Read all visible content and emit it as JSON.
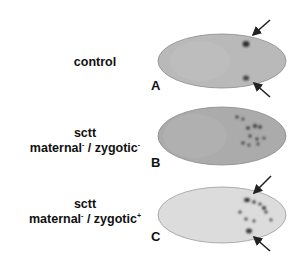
{
  "figure": {
    "panels": [
      {
        "letter": "A",
        "label_lines": [
          "control"
        ],
        "fill": "#b8b8b8",
        "arrows": 2
      },
      {
        "letter": "B",
        "label_lines": [
          "sctt"
        ],
        "genotype": {
          "maternal": "maternal",
          "maternal_sup": "-",
          "sep": " / ",
          "zygotic": "zygotic",
          "zygotic_sup": "-"
        },
        "fill": "#adadad",
        "arrows": 0
      },
      {
        "letter": "C",
        "label_lines": [
          "sctt"
        ],
        "genotype": {
          "maternal": "maternal",
          "maternal_sup": "-",
          "sep": " / ",
          "zygotic": "zygotic",
          "zygotic_sup": "+"
        },
        "fill": "#dedede",
        "arrows": 2
      }
    ]
  }
}
